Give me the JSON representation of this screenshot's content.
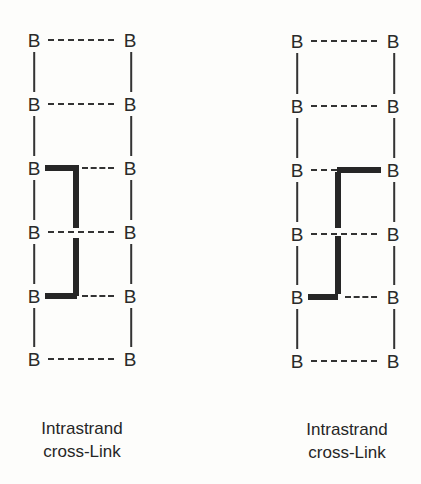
{
  "diagrams": [
    {
      "id": "left",
      "label_line1": "Intrastrand",
      "label_line2": "cross-Link",
      "base_label": "B",
      "rows": 6,
      "crosslink": {
        "top_row": 3,
        "top_side": "left",
        "bottom_row": 5,
        "bottom_side": "left"
      }
    },
    {
      "id": "right",
      "label_line1": "Intrastrand",
      "label_line2": "cross-Link",
      "base_label": "B",
      "rows": 6,
      "crosslink": {
        "top_row": 3,
        "top_side": "right",
        "bottom_row": 5,
        "bottom_side": "left"
      }
    }
  ],
  "colors": {
    "ink": "#262626",
    "background": "#fdfdfb"
  }
}
